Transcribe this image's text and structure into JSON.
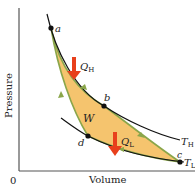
{
  "diagram": {
    "axes": {
      "ylabel": "Pressure",
      "xlabel": "Volume",
      "origin": "0"
    },
    "points": [
      {
        "id": "a",
        "label": "a"
      },
      {
        "id": "b",
        "label": "b"
      },
      {
        "id": "c",
        "label": "c"
      },
      {
        "id": "d",
        "label": "d"
      }
    ],
    "isotherms": {
      "hot": {
        "label": "T",
        "sub": "H"
      },
      "cold": {
        "label": "T",
        "sub": "L"
      }
    },
    "heat": {
      "in": {
        "label": "Q",
        "sub": "H"
      },
      "out": {
        "label": "Q",
        "sub": "L"
      }
    },
    "work": {
      "label": "W"
    },
    "colors": {
      "fill": "#f5c46e",
      "edge": "#8aa64a",
      "arrow": "#e8401c",
      "curve": "#111111",
      "axis": "#555555"
    }
  }
}
